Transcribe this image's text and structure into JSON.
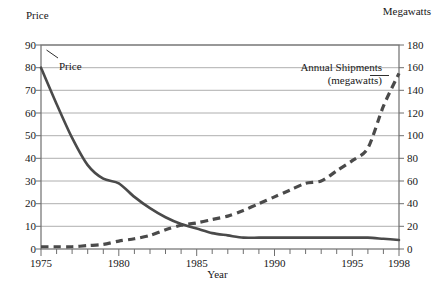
{
  "chart_data": {
    "type": "line",
    "title": "",
    "xlabel": "Year",
    "ylabel": "Price",
    "y2label": "Megawatts",
    "grid": true,
    "legend_position": "inline-annotations",
    "xlim": [
      1975,
      1998
    ],
    "xticks": [
      1975,
      1980,
      1985,
      1990,
      1995,
      1998
    ],
    "xtick_labels": [
      "1975",
      "1980",
      "1985",
      "1990",
      "1995",
      "1998"
    ],
    "xtick_minor_step": 1,
    "ylim": [
      0,
      90
    ],
    "yticks": [
      0,
      10,
      20,
      30,
      40,
      50,
      60,
      70,
      80,
      90
    ],
    "ytick_labels": [
      "0",
      "10",
      "20",
      "30",
      "40",
      "50",
      "60",
      "70",
      "80",
      "90"
    ],
    "y2lim": [
      0,
      180
    ],
    "y2ticks": [
      0,
      20,
      40,
      60,
      80,
      100,
      120,
      140,
      160,
      180
    ],
    "y2tick_labels": [
      "0",
      "20",
      "40",
      "60",
      "80",
      "100",
      "120",
      "140",
      "160",
      "180"
    ],
    "series": [
      {
        "name": "Price",
        "axis": "left",
        "style": "solid",
        "color": "#4a4a4a",
        "width": 2.6,
        "annotation": "Price",
        "x": [
          1975,
          1976,
          1977,
          1978,
          1979,
          1980,
          1981,
          1982,
          1983,
          1984,
          1985,
          1986,
          1987,
          1988,
          1989,
          1990,
          1991,
          1992,
          1993,
          1994,
          1995,
          1996,
          1997,
          1998
        ],
        "values": [
          80,
          64,
          49,
          37,
          31,
          29,
          23,
          18,
          14,
          11,
          9,
          7,
          6,
          5,
          5,
          5,
          5,
          5,
          5,
          5,
          5,
          5,
          4.5,
          4
        ]
      },
      {
        "name": "Annual Shipments (megawatts)",
        "axis": "right",
        "style": "dashed",
        "color": "#4a4a4a",
        "width": 3.2,
        "annotation_line1": "Annual Shipments",
        "annotation_line2": "(megawatts)",
        "x": [
          1975,
          1976,
          1977,
          1978,
          1979,
          1980,
          1981,
          1982,
          1983,
          1984,
          1985,
          1986,
          1987,
          1988,
          1989,
          1990,
          1991,
          1992,
          1993,
          1994,
          1995,
          1996,
          1997,
          1998
        ],
        "values": [
          2,
          2,
          2,
          3,
          4,
          7,
          9,
          12,
          17,
          21,
          23,
          26,
          29,
          34,
          40,
          46,
          52,
          58,
          60,
          69,
          78,
          89,
          126,
          155
        ]
      }
    ]
  },
  "labels": {
    "left_axis_title": "Price",
    "right_axis_title": "Megawatts",
    "x_axis_title": "Year",
    "price_annotation": "Price",
    "shipments_annotation_line1": "Annual Shipments",
    "shipments_annotation_line2": "(megawatts)"
  },
  "colors": {
    "background": "#ffffff",
    "frame": "#6f6f6f",
    "gridline": "#9a9a9a",
    "price_line": "#4a4a4a",
    "shipments_line": "#4a4a4a",
    "text": "#171717"
  }
}
